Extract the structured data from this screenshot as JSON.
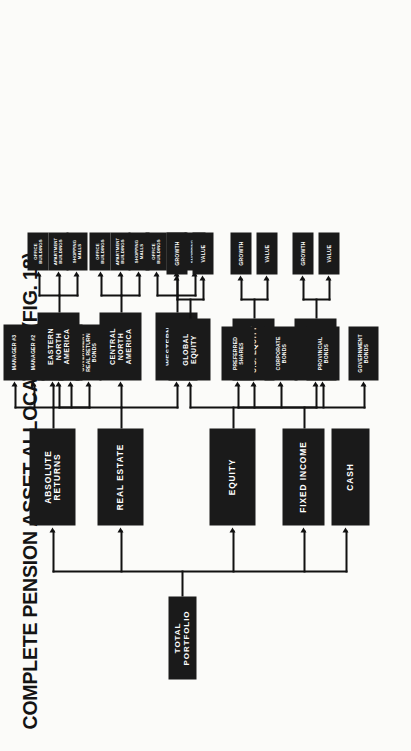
{
  "title": "COMPLETE PENSION ASSET ALLOCATION (FIG. 18)",
  "root": {
    "label": "TOTAL PORTFOLIO"
  },
  "level1": [
    {
      "id": "cash",
      "label": "CASH"
    },
    {
      "id": "fixed-income",
      "label": "FIXED INCOME"
    },
    {
      "id": "equity",
      "label": "EQUITY"
    },
    {
      "id": "real-estate",
      "label": "REAL ESTATE"
    },
    {
      "id": "absolute-returns",
      "label": "ABSOLUTE RETURNS"
    }
  ],
  "fixed_income_children": [
    {
      "label": "GOVERNMENT BONDS"
    },
    {
      "label": "PROVINCIAL BONDS"
    },
    {
      "label": "CORPORATE BONDS"
    },
    {
      "label": "PREFERRED SHARES"
    }
  ],
  "equity_children": [
    {
      "label": "CANADIAN EQUITY"
    },
    {
      "label": "U.S. EQUITY"
    },
    {
      "label": "GLOBAL EQUITY"
    }
  ],
  "equity_styles": [
    {
      "label": "VALUE"
    },
    {
      "label": "GROWTH"
    }
  ],
  "real_estate_children": [
    {
      "label": "WESTERN NORTH AMERICA"
    },
    {
      "label": "CENTRAL NORTH AMERICA"
    },
    {
      "label": "EASTERN NORTH AMERICA"
    }
  ],
  "property_types": [
    {
      "label": "SHOPPING MALLS"
    },
    {
      "label": "APARTMENT BUILDINGS"
    },
    {
      "label": "OFFICE BUILDINGS"
    }
  ],
  "absolute_returns_children": [
    {
      "label": "GOVERNMENT REAL RETURN BONDS"
    },
    {
      "label": "PROVINCIAL REAL RETURN BONDS"
    },
    {
      "label": "MANAGER #1"
    },
    {
      "label": "MANAGER #2"
    },
    {
      "label": "MANAGER #3"
    }
  ],
  "colors": {
    "node_fill": "#1a1a1a",
    "node_text": "#ffffff",
    "line": "#111111",
    "background": "#fbfbf9"
  }
}
